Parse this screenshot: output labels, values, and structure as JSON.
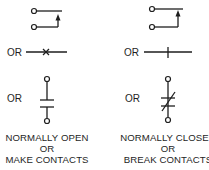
{
  "colors": {
    "ink": "#1e1e1e",
    "background": "#ffffff"
  },
  "connector_label": "OR",
  "columns": [
    {
      "id": "normally-open",
      "symbols": [
        "relay-contact-open-icon",
        "line-contact-x-icon",
        "capacitor-style-contact-open-icon"
      ],
      "caption": [
        "NORMALLY OPEN",
        "OR",
        "MAKE CONTACTS"
      ]
    },
    {
      "id": "normally-closed",
      "symbols": [
        "relay-contact-closed-icon",
        "line-contact-tick-icon",
        "capacitor-style-contact-closed-icon"
      ],
      "caption": [
        "NORMALLY CLOSED",
        "OR",
        "BREAK CONTACTS"
      ]
    }
  ]
}
